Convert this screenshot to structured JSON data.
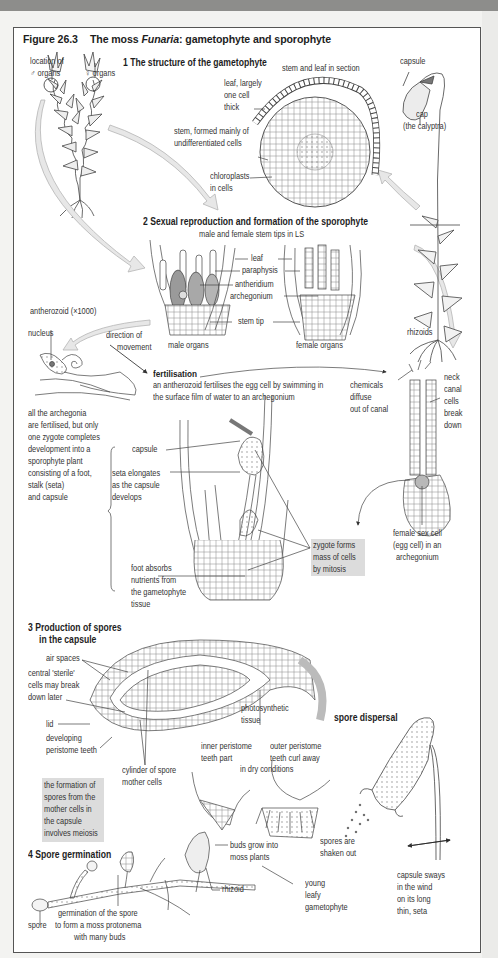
{
  "figure": {
    "number": "Figure 26.3",
    "title_prefix": "The moss ",
    "title_italic": "Funaria",
    "title_suffix": ": gametophyte and sporophyte"
  },
  "section1": {
    "heading": "1 The structure of the gametophyte",
    "labels": {
      "male_location_1": "location of",
      "male_location_2": "♂ organs",
      "female_organs": "♀ organs",
      "stem_leaf_section": "stem and leaf in section",
      "leaf_1": "leaf, largely",
      "leaf_2": "one cell",
      "leaf_3": "thick",
      "stem_1": "stem, formed mainly of",
      "stem_2": "undifferentiated cells",
      "chloro_1": "chloroplasts",
      "chloro_2": "in cells",
      "capsule": "capsule",
      "cap_1": "cap",
      "cap_2": "(the calyptra)",
      "rhizoids": "rhizoids"
    }
  },
  "section2": {
    "heading": "2 Sexual reproduction and formation of the sporophyte",
    "subheading": "male and female stem tips in LS",
    "labels": {
      "leaf": "leaf",
      "paraphysis": "paraphysis",
      "antheridium": "antheridium",
      "archegonium": "archegonium",
      "stem_tip": "stem tip",
      "male_organs": "male organs",
      "female_organs": "female organs",
      "antherozoid": "antherozoid (×1000)",
      "nucleus": "nucleus",
      "direction_1": "direction of",
      "direction_2": "movement",
      "fertilisation_heading": "fertilisation",
      "fert_1": "an antherozoid fertilises the egg cell by swimming in",
      "fert_2": "the surface film of water to an archegonium",
      "chem_1": "chemicals",
      "chem_2": "diffuse",
      "chem_3": "out of canal",
      "neck_1": "neck",
      "neck_2": "canal",
      "neck_3": "cells",
      "neck_4": "break",
      "neck_5": "down",
      "archeg_note": [
        "all the archegonia",
        "are fertilised, but only",
        "one zygote completes",
        "development into a",
        "sporophyte plant",
        "consisting of a foot,",
        "stalk (seta)",
        "and capsule"
      ],
      "capsule": "capsule",
      "seta_1": "seta elongates",
      "seta_2": "as the capsule",
      "seta_3": "develops",
      "foot_1": "foot absorbs",
      "foot_2": "nutrients from",
      "foot_3": "the gametophyte",
      "foot_4": "tissue",
      "zygote_1": "zygote forms",
      "zygote_2": "mass of cells",
      "zygote_3": "by mitosis",
      "egg_1": "female sex cell",
      "egg_2": "(egg cell) in an",
      "egg_3": "archegonium"
    }
  },
  "section3": {
    "heading_1": "3  Production of spores",
    "heading_2": "in the capsule",
    "labels": {
      "air_spaces": "air spaces",
      "sterile_1": "central 'sterile'",
      "sterile_2": "cells may break",
      "sterile_3": "down later",
      "lid": "lid",
      "peri_1": "developing",
      "peri_2": "peristome teeth",
      "photo_1": "photosynthetic",
      "photo_2": "tissue",
      "cyl_1": "cylinder of spore",
      "cyl_2": "mother cells",
      "meiosis": [
        "the formation of",
        "spores from the",
        "mother cells in",
        "the capsule",
        "involves meiosis"
      ],
      "inner_1": "inner peristome",
      "inner_2": "teeth part",
      "outer_1": "outer peristome",
      "outer_2": "teeth curl away",
      "dry": "in dry conditions",
      "dispersal_heading": "spore dispersal",
      "shaken_1": "spores are",
      "shaken_2": "shaken out",
      "sway_1": "capsule sways",
      "sway_2": "in the wind",
      "sway_3": "on its long",
      "sway_4": "thin, seta"
    }
  },
  "section4": {
    "heading": "4  Spore germination",
    "labels": {
      "buds_1": "buds grow into",
      "buds_2": "moss plants",
      "young_1": "young",
      "young_2": "leafy",
      "young_3": "gametophyte",
      "rhizoid": "rhizoid",
      "spore": "spore",
      "germ_1": "germination of the spore",
      "germ_2": "to form a moss protonema",
      "germ_3": "with many buds"
    }
  },
  "colors": {
    "frame_border": "#555555",
    "highlight_box": "#dcdcdc",
    "arrow_fill": "#e4e4e4",
    "top_band": "#8d8d8b"
  }
}
